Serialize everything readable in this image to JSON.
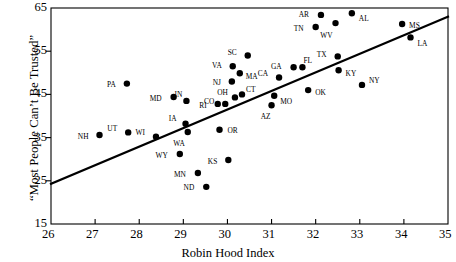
{
  "chart_data": {
    "type": "scatter",
    "title": "",
    "xlabel": "Robin Hood Index",
    "ylabel": "“Most People Can’t Be Trusted”",
    "xlim": [
      26,
      35
    ],
    "ylim": [
      15,
      65
    ],
    "xticks": [
      26,
      27,
      28,
      29,
      30,
      31,
      32,
      33,
      34,
      35
    ],
    "yticks": [
      15,
      25,
      35,
      45,
      55,
      65
    ],
    "grid": false,
    "legend": null,
    "trendline": {
      "name": "regression-line",
      "x_start": 26,
      "y_start": 24.3,
      "x_end": 35,
      "y_end": 63.0
    },
    "points": [
      {
        "label": "NH",
        "x": 27.1,
        "y": 35.6,
        "lx": -11,
        "ly": 1
      },
      {
        "label": "UT",
        "x": 27.75,
        "y": 36.2,
        "lx": -11,
        "ly": -4
      },
      {
        "label": "PA",
        "x": 27.72,
        "y": 47.5,
        "lx": -11,
        "ly": 1
      },
      {
        "label": "WI",
        "x": 28.38,
        "y": 35.2,
        "lx": -11,
        "ly": -4
      },
      {
        "label": "MD",
        "x": 28.78,
        "y": 44.4,
        "lx": -12,
        "ly": 1
      },
      {
        "label": "WY",
        "x": 28.92,
        "y": 31.2,
        "lx": -12,
        "ly": 1
      },
      {
        "label": "IA",
        "x": 29.05,
        "y": 38.2,
        "lx": -9,
        "ly": -5
      },
      {
        "label": "IN",
        "x": 29.07,
        "y": 43.5,
        "lx": -4,
        "ly": -6
      },
      {
        "label": "WA",
        "x": 29.1,
        "y": 36.3,
        "lx": -3,
        "ly": 11
      },
      {
        "label": "MN",
        "x": 29.33,
        "y": 26.8,
        "lx": -12,
        "ly": 1
      },
      {
        "label": "ND",
        "x": 29.52,
        "y": 23.6,
        "lx": -12,
        "ly": 1
      },
      {
        "label": "RI",
        "x": 29.78,
        "y": 42.8,
        "lx": -11,
        "ly": 1
      },
      {
        "label": "OR",
        "x": 29.82,
        "y": 36.8,
        "lx": 8,
        "ly": 1
      },
      {
        "label": "CO",
        "x": 29.95,
        "y": 42.8,
        "lx": -11,
        "ly": -3
      },
      {
        "label": "KS",
        "x": 30.02,
        "y": 29.8,
        "lx": -11,
        "ly": 1
      },
      {
        "label": "NJ",
        "x": 30.1,
        "y": 48.0,
        "lx": -11,
        "ly": 1
      },
      {
        "label": "VA",
        "x": 30.12,
        "y": 51.5,
        "lx": -11,
        "ly": -1
      },
      {
        "label": "OH",
        "x": 30.17,
        "y": 44.3,
        "lx": -7,
        "ly": -5
      },
      {
        "label": "MA",
        "x": 30.28,
        "y": 49.9,
        "lx": 6,
        "ly": 3
      },
      {
        "label": "CT",
        "x": 30.33,
        "y": 45.0,
        "lx": 4,
        "ly": -5
      },
      {
        "label": "SC",
        "x": 30.46,
        "y": 54.0,
        "lx": -11,
        "ly": -3
      },
      {
        "label": "AZ",
        "x": 31.0,
        "y": 42.5,
        "lx": -1,
        "ly": 11
      },
      {
        "label": "MO",
        "x": 31.06,
        "y": 44.7,
        "lx": 6,
        "ly": 6
      },
      {
        "label": "CA",
        "x": 31.17,
        "y": 48.9,
        "lx": -11,
        "ly": -4
      },
      {
        "label": "GA",
        "x": 31.5,
        "y": 51.3,
        "lx": -12,
        "ly": -1
      },
      {
        "label": "FL",
        "x": 31.7,
        "y": 51.3,
        "lx": 1,
        "ly": -7
      },
      {
        "label": "OK",
        "x": 31.83,
        "y": 46.0,
        "lx": 7,
        "ly": 2
      },
      {
        "label": "AR",
        "x": 32.12,
        "y": 63.4,
        "lx": -12,
        "ly": -1
      },
      {
        "label": "TN",
        "x": 32.0,
        "y": 60.6,
        "lx": -12,
        "ly": 1
      },
      {
        "label": "WV",
        "x": 32.45,
        "y": 61.5,
        "lx": -3,
        "ly": 12
      },
      {
        "label": "TX",
        "x": 32.5,
        "y": 53.8,
        "lx": -11,
        "ly": -2
      },
      {
        "label": "KY",
        "x": 32.52,
        "y": 50.6,
        "lx": 7,
        "ly": 3
      },
      {
        "label": "AL",
        "x": 32.82,
        "y": 63.8,
        "lx": 7,
        "ly": 5
      },
      {
        "label": "NY",
        "x": 33.05,
        "y": 47.2,
        "lx": 7,
        "ly": -4
      },
      {
        "label": "MS",
        "x": 33.96,
        "y": 61.3,
        "lx": 7,
        "ly": 1
      },
      {
        "label": "LA",
        "x": 34.15,
        "y": 58.2,
        "lx": 7,
        "ly": 6
      }
    ],
    "point_radius": 3.2,
    "colors": {
      "point": "#000000",
      "line": "#000000",
      "axis": "#000000",
      "background": "#ffffff"
    }
  }
}
